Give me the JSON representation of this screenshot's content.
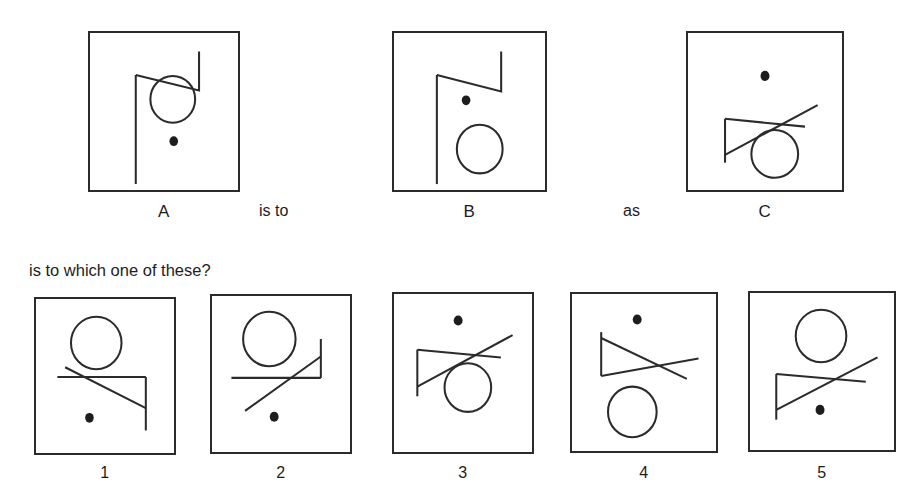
{
  "test": {
    "type": "visual-analogy-item",
    "prompt_line": "is to which one of these?",
    "connector_is_to": "is to",
    "connector_as": "as"
  },
  "stimuli": [
    {
      "id": "A",
      "label": "A",
      "box": {
        "x": 88,
        "y": 31,
        "width": 152,
        "height": 161
      },
      "description": "flag pointing right, circle right of pole, dot below circle",
      "elements": {
        "flag": {
          "orientation": "pole-vertical-left",
          "flag_direction": "right",
          "notch": "down"
        },
        "circle": {
          "cx": 0.56,
          "cy": 0.42,
          "r": 0.14
        },
        "dot": {
          "cx": 0.56,
          "cy": 0.69
        }
      }
    },
    {
      "id": "B",
      "label": "B",
      "box": {
        "x": 392,
        "y": 31,
        "width": 155,
        "height": 161
      },
      "description": "same flag, dot above circle, circle lower",
      "elements": {
        "flag": {
          "orientation": "pole-vertical-left",
          "flag_direction": "right",
          "notch": "down"
        },
        "circle": {
          "cx": 0.56,
          "cy": 0.7,
          "r": 0.14
        },
        "dot": {
          "cx": 0.48,
          "cy": 0.43
        }
      }
    },
    {
      "id": "C",
      "label": "C",
      "box": {
        "x": 686,
        "y": 31,
        "width": 158,
        "height": 161
      },
      "description": "rotated flag with crossing diagonal, dot above, circle below right",
      "elements": {
        "flag": {
          "orientation": "rotated-crossed",
          "flag_direction": "right-up"
        },
        "circle": {
          "cx": 0.58,
          "cy": 0.76,
          "r": 0.145
        },
        "dot": {
          "cx": 0.5,
          "cy": 0.27
        }
      }
    }
  ],
  "options": [
    {
      "id": "1",
      "label": "1",
      "box": {
        "x": 34,
        "y": 297,
        "width": 142,
        "height": 158
      },
      "description": "horizontal pole on top-left, vertical stem down right, circle above, dot below-left"
    },
    {
      "id": "2",
      "label": "2",
      "box": {
        "x": 210,
        "y": 294,
        "width": 142,
        "height": 160
      },
      "description": "long diagonal rising to right with flag notch, circle above-left, dot below"
    },
    {
      "id": "3",
      "label": "3",
      "box": {
        "x": 392,
        "y": 292,
        "width": 142,
        "height": 162
      },
      "description": "rotated crossed flag, dot above-left, circle below-right"
    },
    {
      "id": "4",
      "label": "4",
      "box": {
        "x": 570,
        "y": 292,
        "width": 148,
        "height": 161
      },
      "description": "triangle flag with diagonal descending right, dot above, circle below"
    },
    {
      "id": "5",
      "label": "5",
      "box": {
        "x": 748,
        "y": 291,
        "width": 148,
        "height": 161
      },
      "description": "rotated crossed flag, circle above, dot below-right"
    }
  ],
  "labels": {
    "A": "A",
    "B": "B",
    "C": "C",
    "one": "1",
    "two": "2",
    "three": "3",
    "four": "4",
    "five": "5"
  },
  "colors": {
    "ink": "#2b2b2b",
    "text": "#1d1d1d",
    "background": "#ffffff"
  }
}
